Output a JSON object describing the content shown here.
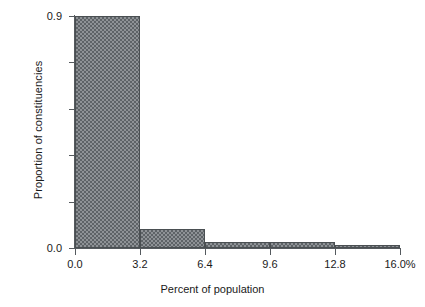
{
  "chart_data": {
    "type": "bar",
    "title": "",
    "subtitle": "",
    "xlabel": "Percent of population",
    "ylabel": "Proportion of constituencies",
    "xlim": [
      0.0,
      16.0
    ],
    "ylim": [
      0.0,
      0.9
    ],
    "grid": false,
    "legend": null,
    "x_tick_labels": [
      "0.0",
      "3.2",
      "6.4",
      "9.6",
      "12.8",
      "16.0%"
    ],
    "x_tick_values": [
      0.0,
      3.2,
      6.4,
      9.6,
      12.8,
      16.0
    ],
    "y_tick_labels": [
      "0.0",
      "0.9"
    ],
    "y_tick_values": [
      0.0,
      0.9
    ],
    "y_minor_tick_values": [
      0.18,
      0.36,
      0.54,
      0.72
    ],
    "bin_edges": [
      0.0,
      3.2,
      6.4,
      9.6,
      12.8,
      16.0
    ],
    "categories": [
      "0.0-3.2",
      "3.2-6.4",
      "6.4-9.6",
      "9.6-12.8",
      "12.8-16.0"
    ],
    "values": [
      0.9,
      0.074,
      0.023,
      0.023,
      0.012
    ],
    "bar_fill_color": "#8e9296",
    "bar_pattern": "checkerboard-dither",
    "bar_edge_color": "#4a4f52",
    "axis_color": "#555a5e",
    "background_color": "#ffffff"
  },
  "axes": {
    "x_title": "Percent of population",
    "y_title": "Proportion of constituencies",
    "y_ticks": [
      {
        "label": "0.9",
        "value": 0.9
      },
      {
        "label": "0.0",
        "value": 0.0
      }
    ],
    "x_ticks": [
      {
        "label": "0.0",
        "value": 0.0
      },
      {
        "label": "3.2",
        "value": 3.2
      },
      {
        "label": "6.4",
        "value": 6.4
      },
      {
        "label": "9.6",
        "value": 9.6
      },
      {
        "label": "12.8",
        "value": 12.8
      },
      {
        "label": "16.0%",
        "value": 16.0
      }
    ]
  }
}
